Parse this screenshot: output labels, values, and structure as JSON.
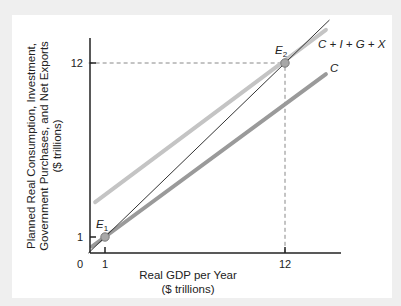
{
  "chart_data": {
    "type": "line",
    "title": "",
    "xlabel": "Real GDP per Year\n($ trillions)",
    "xlabel_lines": [
      "Real GDP per Year",
      "($ trillions)"
    ],
    "ylabel": "Planned Real Consumption, Investment, Government Purchases, and Net Exports ($ trillions)",
    "ylabel_lines": [
      "Planned Real Consumption, Investment,",
      "Government Purchases, and Net Exports",
      "($ trillions)"
    ],
    "origin_label": "0",
    "x_ticks": [
      1,
      12
    ],
    "y_ticks": [
      1,
      12
    ],
    "xlim": [
      0,
      15.5
    ],
    "ylim": [
      0,
      13.5
    ],
    "grid": false,
    "series": [
      {
        "name": "45-degree line",
        "label": "",
        "x": [
          0,
          14.7
        ],
        "y": [
          0,
          14.7
        ],
        "color": "#333333",
        "width": 1
      },
      {
        "name": "C + I + G + X",
        "label": "C + I + G + X",
        "x": [
          0.4,
          14.5
        ],
        "y": [
          3.2,
          14.1
        ],
        "color": "#c4c4c4",
        "width": 4
      },
      {
        "name": "C",
        "label": "C",
        "x": [
          0.2,
          14.5
        ],
        "y": [
          0.4,
          11.3
        ],
        "color": "#9a9a9a",
        "width": 4
      }
    ],
    "points": [
      {
        "name": "E1",
        "label": "E",
        "subscript": "1",
        "x": 1,
        "y": 1
      },
      {
        "name": "E2",
        "label": "E",
        "subscript": "2",
        "x": 12,
        "y": 12
      }
    ],
    "annotations": [
      {
        "type": "dashed-guide",
        "from": [
          0,
          12
        ],
        "to": [
          12,
          12
        ]
      },
      {
        "type": "dashed-guide",
        "from": [
          12,
          0
        ],
        "to": [
          12,
          12
        ]
      }
    ]
  }
}
